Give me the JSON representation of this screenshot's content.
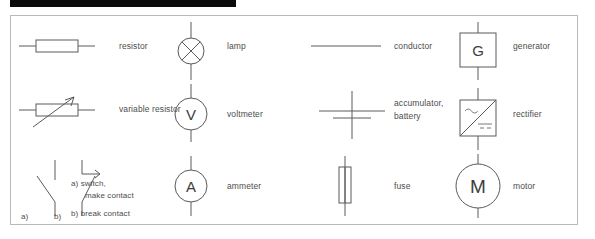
{
  "page": {
    "frame_border_color": "#b9b9b9",
    "ink_color": "#5a5a5a",
    "text_color": "#4d4d4d",
    "topbar_color": "#0b0b0b"
  },
  "columns": [
    {
      "name": "column-1",
      "items": [
        {
          "symbol": "resistor-symbol",
          "label": "resistor"
        },
        {
          "symbol": "variable-resistor-symbol",
          "label": "variable resistor"
        },
        {
          "symbol": "switch-symbol",
          "label": "a)  switch,\n     make contact\n\nb)  break contact",
          "label_lines": [
            "a)  switch,",
            "make contact",
            "b)  break contact"
          ],
          "sublabels": [
            "a)",
            "b)"
          ]
        }
      ]
    },
    {
      "name": "column-2",
      "items": [
        {
          "symbol": "lamp-symbol",
          "label": "lamp",
          "glyph": ""
        },
        {
          "symbol": "voltmeter-symbol",
          "label": "voltmeter",
          "glyph": "V"
        },
        {
          "symbol": "ammeter-symbol",
          "label": "ammeter",
          "glyph": "A"
        }
      ]
    },
    {
      "name": "column-3",
      "items": [
        {
          "symbol": "conductor-symbol",
          "label": "conductor"
        },
        {
          "symbol": "accumulator-battery-symbol",
          "label": "accumulator,\nbattery",
          "label_lines": [
            "accumulator,",
            "battery"
          ]
        },
        {
          "symbol": "fuse-symbol",
          "label": "fuse"
        }
      ]
    },
    {
      "name": "column-4",
      "items": [
        {
          "symbol": "generator-symbol",
          "label": "generator",
          "glyph": "G"
        },
        {
          "symbol": "rectifier-symbol",
          "label": "rectifier",
          "glyph_ac": "~",
          "glyph_dc": "="
        },
        {
          "symbol": "motor-symbol",
          "label": "motor",
          "glyph": "M"
        }
      ]
    }
  ]
}
